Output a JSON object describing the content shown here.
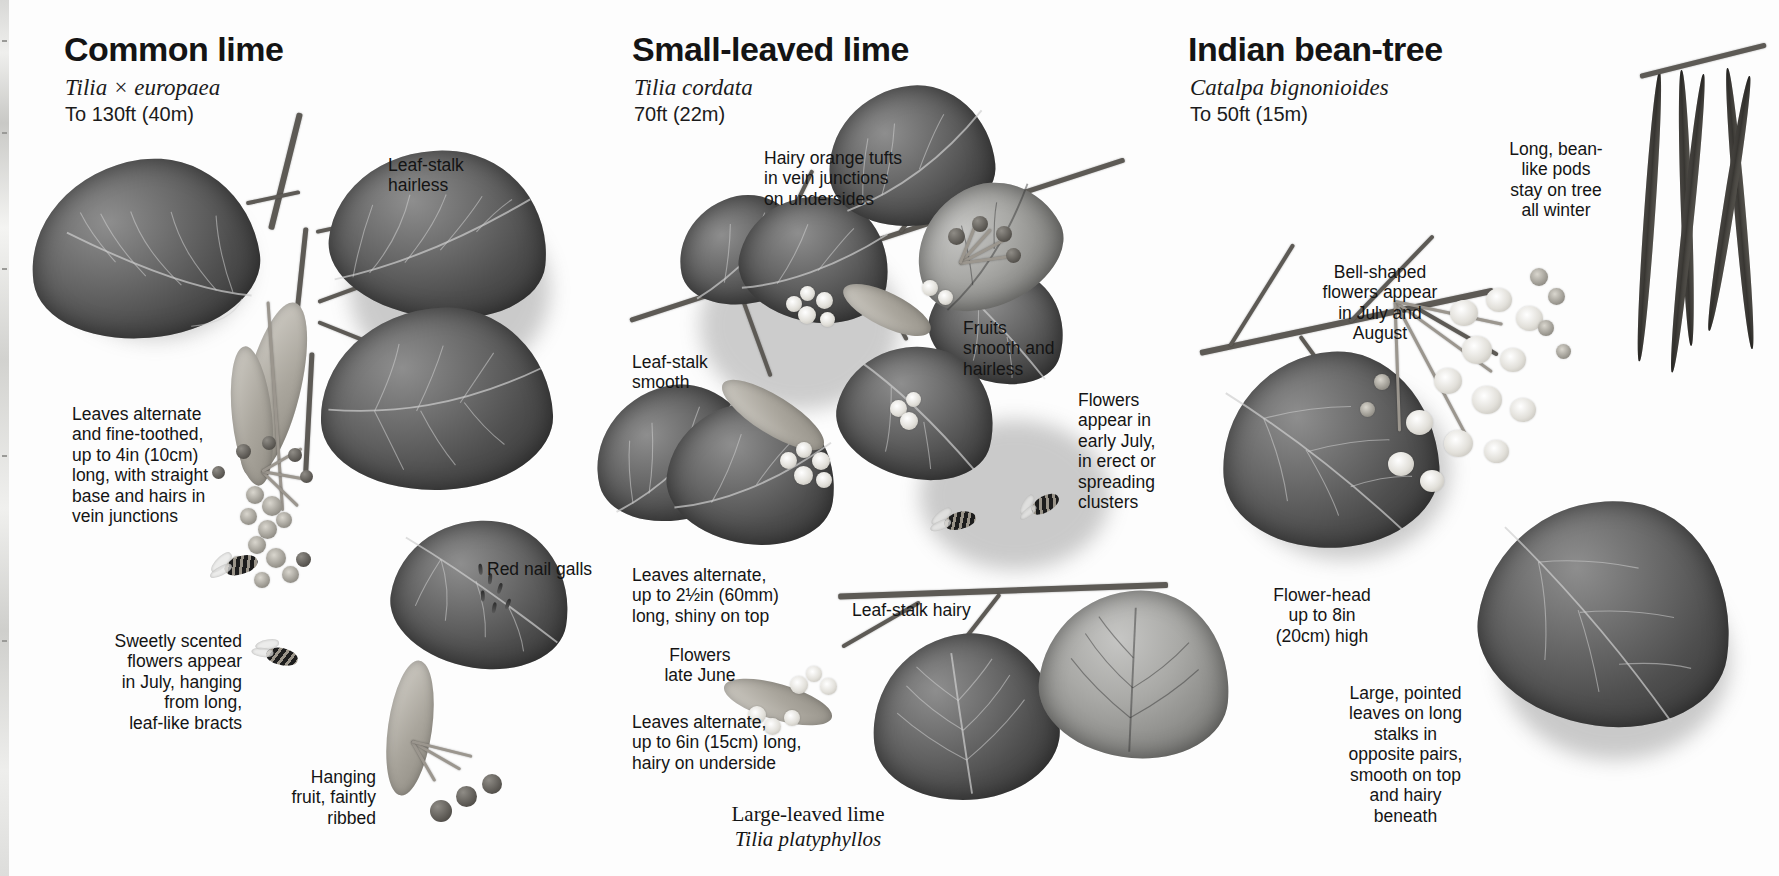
{
  "page": {
    "kind": "field-guide-spread",
    "background": "#ffffff",
    "ink": "#141414"
  },
  "species": [
    {
      "id": "common-lime",
      "common_name": "Common lime",
      "latin_name": "Tilia × europaea",
      "height": "To 130ft (40m)",
      "captions": [
        {
          "id": "leaf-stalk-hairless",
          "text": "Leaf-stalk\nhairless",
          "align": "left"
        },
        {
          "id": "leaves-alternate",
          "text": "Leaves alternate\nand fine-toothed,\nup to 4in (10cm)\nlong, with straight\nbase and hairs in\nvein junctions",
          "align": "left"
        },
        {
          "id": "red-nail-galls",
          "text": "Red nail galls",
          "align": "left"
        },
        {
          "id": "sweetly-scented",
          "text": "Sweetly scented\nflowers appear\nin July, hanging\nfrom long,\nleaf-like bracts",
          "align": "right"
        },
        {
          "id": "hanging-fruit",
          "text": "Hanging\nfruit, faintly\nribbed",
          "align": "right"
        }
      ]
    },
    {
      "id": "small-leaved-lime",
      "common_name": "Small-leaved lime",
      "latin_name": "Tilia cordata",
      "height": "70ft (22m)",
      "captions": [
        {
          "id": "hairy-orange-tufts",
          "text": "Hairy orange tufts\nin vein junctions\non undersides",
          "align": "left"
        },
        {
          "id": "leaf-stalk-smooth",
          "text": "Leaf-stalk\nsmooth",
          "align": "left"
        },
        {
          "id": "fruits-smooth",
          "text": "Fruits\nsmooth and\nhairless",
          "align": "left"
        },
        {
          "id": "leaves-alternate-small",
          "text": "Leaves alternate,\nup to 2½in (60mm)\nlong, shiny on top",
          "align": "left"
        },
        {
          "id": "leaf-stalk-hairy",
          "text": "Leaf-stalk hairy",
          "align": "left"
        },
        {
          "id": "flowers-late-june",
          "text": "Flowers\nlate June",
          "align": "center"
        },
        {
          "id": "leaves-alternate-large",
          "text": "Leaves alternate,\nup to 6in (15cm) long,\nhairy on underside",
          "align": "left"
        }
      ],
      "sub_species": {
        "id": "large-leaved-lime",
        "common_name": "Large-leaved lime",
        "latin_name": "Tilia platyphyllos"
      }
    },
    {
      "id": "indian-bean-tree",
      "common_name": "Indian bean-tree",
      "latin_name": "Catalpa bignonioides",
      "height": "To 50ft (15m)",
      "captions": [
        {
          "id": "long-bean-like-pods",
          "text": "Long, bean-\nlike pods\nstay on tree\nall winter",
          "align": "center"
        },
        {
          "id": "bell-shaped-flowers",
          "text": "Bell-shaped\nflowers appear\nin July and\nAugust",
          "align": "center"
        },
        {
          "id": "flowers-appear-early-july",
          "text": "Flowers\nappear in\nearly July,\nin erect or\nspreading\nclusters",
          "align": "left"
        },
        {
          "id": "flower-head-size",
          "text": "Flower-head\nup to 8in\n(20cm) high",
          "align": "center"
        },
        {
          "id": "large-pointed-leaves",
          "text": "Large, pointed\nleaves on long\nstalks in\nopposite pairs,\nsmooth on top\nand hairy\nbeneath",
          "align": "center"
        }
      ]
    }
  ]
}
